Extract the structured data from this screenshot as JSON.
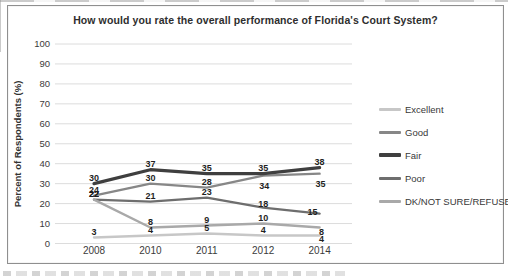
{
  "title": "How would you rate the overall performance of Florida's Court System?",
  "chart_data": {
    "type": "line",
    "title": "How would you rate the overall performance of Florida's Court System?",
    "xlabel": "",
    "ylabel": "Percent of Respondents (%)",
    "categories": [
      "2008",
      "2010",
      "2011",
      "2012",
      "2014"
    ],
    "series": [
      {
        "name": "Excellent",
        "color": "#c7c7c7",
        "values": [
          3,
          4,
          5,
          4,
          4
        ]
      },
      {
        "name": "Good",
        "color": "#878787",
        "values": [
          24,
          30,
          28,
          34,
          35
        ]
      },
      {
        "name": "Fair",
        "color": "#3f3f3f",
        "values": [
          30,
          37,
          35,
          35,
          38
        ]
      },
      {
        "name": "Poor",
        "color": "#6e6e6e",
        "values": [
          22,
          21,
          23,
          18,
          15
        ]
      },
      {
        "name": "DK/NOT SURE/REFUSE",
        "color": "#a9a9a9",
        "values": [
          22,
          8,
          9,
          10,
          8
        ]
      }
    ],
    "ylim": [
      0,
      100
    ],
    "y_ticks": [
      0,
      10,
      20,
      30,
      40,
      50,
      60,
      70,
      80,
      90,
      100
    ],
    "grid": true,
    "grid_color": "#dcdcdc",
    "data_labels": true,
    "legend_position": "right"
  }
}
